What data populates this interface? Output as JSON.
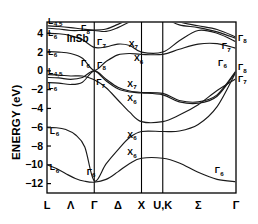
{
  "figure": {
    "material": "InSb",
    "ylabel": "ENERGY (eV)",
    "frame_color": "#000000",
    "band_color": "#1a1a1a",
    "background": "#ffffff"
  },
  "chart_data": {
    "type": "line",
    "title": "InSb",
    "xlabel": "",
    "ylabel": "ENERGY (eV)",
    "ylim": [
      -13.0,
      5.2
    ],
    "xlim": [
      0,
      4
    ],
    "grid": false,
    "legend": "none",
    "xticks": [
      {
        "pos": 0.0,
        "label": "L"
      },
      {
        "pos": 1.0,
        "label": "Γ"
      },
      {
        "pos": 2.0,
        "label": "X"
      },
      {
        "pos": 2.45,
        "label": "U,K"
      },
      {
        "pos": 4.0,
        "label": "Γ"
      }
    ],
    "xtick_midlabels": [
      {
        "pos": 0.5,
        "label": "Λ"
      },
      {
        "pos": 1.5,
        "label": "Δ"
      },
      {
        "pos": 3.2,
        "label": "Σ"
      }
    ],
    "yticks": [
      4,
      2,
      0,
      -2,
      -4,
      -6,
      -8,
      -10,
      -12
    ],
    "ytick_labels": [
      "4",
      "2",
      "0",
      "−2",
      "−4",
      "−6",
      "−8",
      "−10",
      "−12"
    ],
    "symmetry_lines": [
      1.0,
      2.0,
      2.45
    ],
    "series": [
      {
        "name": "valence-band-1",
        "x": [
          0.0,
          0.2,
          0.4,
          0.6,
          0.8,
          1.0,
          1.25,
          1.5,
          1.75,
          2.0,
          2.45,
          2.8,
          3.2,
          3.6,
          4.0
        ],
        "values": [
          -10.0,
          -10.4,
          -10.95,
          -11.45,
          -11.75,
          -11.85,
          -11.55,
          -10.75,
          -9.85,
          -9.3,
          -9.3,
          -9.8,
          -10.8,
          -11.55,
          -11.8
        ]
      },
      {
        "name": "valence-band-2",
        "x": [
          0.0,
          0.2,
          0.4,
          0.6,
          0.8,
          1.0,
          1.25,
          1.5,
          1.75,
          2.0,
          2.45,
          2.8,
          3.2,
          3.6,
          4.0
        ],
        "values": [
          -6.05,
          -6.05,
          -6.25,
          -6.8,
          -8.1,
          -11.7,
          -9.9,
          -8.4,
          -7.1,
          -6.45,
          -6.45,
          -6.4,
          -5.7,
          -3.8,
          -0.1
        ]
      },
      {
        "name": "valence-band-3-heavy",
        "x": [
          0.0,
          0.25,
          0.5,
          0.75,
          1.0,
          1.25,
          1.5,
          1.75,
          2.0,
          2.45,
          2.8,
          3.2,
          3.6,
          4.0
        ],
        "values": [
          -1.25,
          -1.3,
          -1.45,
          -1.2,
          0.0,
          -0.9,
          -1.75,
          -2.15,
          -2.3,
          -2.4,
          -3.15,
          -3.3,
          -2.55,
          0.0
        ]
      },
      {
        "name": "valence-band-4-light",
        "x": [
          0.0,
          0.25,
          0.5,
          0.75,
          1.0,
          1.25,
          1.5,
          1.75,
          2.0,
          2.45,
          2.8,
          3.2,
          3.6,
          4.0
        ],
        "values": [
          -0.7,
          -0.75,
          -0.9,
          -0.7,
          0.0,
          -1.05,
          -1.9,
          -2.25,
          -2.35,
          -2.55,
          -3.3,
          -3.45,
          -2.7,
          -0.1
        ]
      },
      {
        "name": "split-off-band",
        "x": [
          0.0,
          0.25,
          0.5,
          0.75,
          1.0,
          1.25,
          1.5,
          1.75,
          2.0,
          2.45,
          2.8,
          3.2,
          3.6,
          4.0
        ],
        "values": [
          -0.4,
          -0.45,
          -0.55,
          -0.55,
          -0.95,
          -1.8,
          -3.1,
          -4.4,
          -5.4,
          -5.4,
          -4.7,
          -3.6,
          -2.1,
          -0.85
        ]
      },
      {
        "name": "conduction-band-1",
        "x": [
          0.0,
          0.25,
          0.5,
          0.75,
          1.0,
          1.25,
          1.5,
          1.75,
          2.0,
          2.45,
          2.8,
          3.2,
          3.6,
          4.0
        ],
        "values": [
          2.05,
          2.0,
          1.85,
          1.35,
          0.05,
          1.0,
          1.7,
          1.85,
          1.75,
          1.75,
          2.3,
          2.85,
          2.9,
          2.4
        ]
      },
      {
        "name": "conduction-band-2",
        "x": [
          0.0,
          0.25,
          0.5,
          0.75,
          1.0,
          1.25,
          1.5,
          1.75,
          2.0,
          2.45,
          2.8,
          3.2,
          3.6,
          4.0
        ],
        "values": [
          4.0,
          3.95,
          3.75,
          3.3,
          2.5,
          2.55,
          2.85,
          2.7,
          2.0,
          2.0,
          3.2,
          4.3,
          4.0,
          3.1
        ]
      },
      {
        "name": "conduction-band-3",
        "x": [
          0.0,
          0.25,
          0.5,
          0.75,
          1.0,
          1.25,
          1.5,
          1.75,
          2.0,
          2.45,
          2.8,
          3.2,
          3.6,
          4.0
        ],
        "values": [
          4.55,
          4.45,
          4.3,
          4.3,
          4.3,
          4.2,
          4.6,
          5.2,
          5.6,
          5.6,
          4.9,
          4.6,
          4.15,
          3.45
        ]
      },
      {
        "name": "conduction-band-4",
        "x": [
          0.0,
          0.25,
          0.5,
          0.75,
          1.0,
          1.25,
          1.5,
          1.75,
          2.0,
          2.45,
          2.8,
          3.2,
          3.6,
          4.0
        ],
        "values": [
          4.8,
          4.72,
          4.6,
          4.45,
          4.35,
          4.45,
          4.95,
          5.5,
          5.9,
          5.9,
          5.2,
          4.8,
          4.4,
          3.6
        ]
      }
    ],
    "annotations": [
      {
        "id": "L45-top",
        "text": "L",
        "sub": "4,5",
        "x": 0.02,
        "y": 5.0,
        "anchor": "start"
      },
      {
        "id": "L6-a",
        "text": "L",
        "sub": "6",
        "x": 0.02,
        "y": 3.7,
        "anchor": "start"
      },
      {
        "id": "L6-b",
        "text": "L",
        "sub": "6",
        "x": 0.02,
        "y": 1.7,
        "anchor": "start"
      },
      {
        "id": "L45-c",
        "text": "L",
        "sub": "4,5",
        "x": 0.02,
        "y": -0.3,
        "anchor": "start"
      },
      {
        "id": "L6-d",
        "text": "L",
        "sub": "6",
        "x": 0.02,
        "y": -1.9,
        "anchor": "start"
      },
      {
        "id": "L6-e",
        "text": "L",
        "sub": "6",
        "x": 0.06,
        "y": -6.7,
        "anchor": "start"
      },
      {
        "id": "L6-f",
        "text": "L",
        "sub": "6",
        "x": 0.06,
        "y": -10.6,
        "anchor": "start"
      },
      {
        "id": "G8-top",
        "text": "Γ",
        "sub": "8",
        "x": 0.72,
        "y": 4.25,
        "anchor": "start"
      },
      {
        "id": "G7-mid",
        "text": "Γ",
        "sub": "7",
        "x": 1.06,
        "y": 2.7,
        "anchor": "start"
      },
      {
        "id": "G6-left",
        "text": "Γ",
        "sub": "6",
        "x": 0.72,
        "y": 0.55,
        "anchor": "start"
      },
      {
        "id": "G8-zero",
        "text": "Γ",
        "sub": "8",
        "x": 1.06,
        "y": 0.35,
        "anchor": "start"
      },
      {
        "id": "G7-low",
        "text": "Γ",
        "sub": "7",
        "x": 1.04,
        "y": -1.55,
        "anchor": "start"
      },
      {
        "id": "G6-bot-l",
        "text": "Γ",
        "sub": "6",
        "x": 0.84,
        "y": -11.05,
        "anchor": "start"
      },
      {
        "id": "X7-upper",
        "text": "X",
        "sub": "7",
        "x": 1.73,
        "y": 2.55,
        "anchor": "start"
      },
      {
        "id": "X6-upper",
        "text": "X",
        "sub": "6",
        "x": 1.84,
        "y": 1.0,
        "anchor": "start"
      },
      {
        "id": "X7-lower",
        "text": "X",
        "sub": "7",
        "x": 1.7,
        "y": -1.7,
        "anchor": "start"
      },
      {
        "id": "X6-a",
        "text": "X",
        "sub": "6",
        "x": 1.7,
        "y": -3.2,
        "anchor": "start"
      },
      {
        "id": "X6-b",
        "text": "X",
        "sub": "6",
        "x": 1.7,
        "y": -7.1,
        "anchor": "start"
      },
      {
        "id": "X6-c",
        "text": "X",
        "sub": "6",
        "x": 1.7,
        "y": -9.0,
        "anchor": "start"
      },
      {
        "id": "G8-right",
        "text": "Γ",
        "sub": "8",
        "x": 4.04,
        "y": 3.2,
        "anchor": "start"
      },
      {
        "id": "G7-right",
        "text": "Γ",
        "sub": "7",
        "x": 3.7,
        "y": 2.3,
        "anchor": "start"
      },
      {
        "id": "G6-right",
        "text": "Γ",
        "sub": "6",
        "x": 3.62,
        "y": 0.55,
        "anchor": "start"
      },
      {
        "id": "G8-r0",
        "text": "Γ",
        "sub": "8",
        "x": 4.04,
        "y": 0.05,
        "anchor": "start"
      },
      {
        "id": "G7-r1",
        "text": "Γ",
        "sub": "7",
        "x": 4.04,
        "y": -1.15,
        "anchor": "start"
      },
      {
        "id": "G6-bot-r",
        "text": "Γ",
        "sub": "6",
        "x": 3.55,
        "y": -10.9,
        "anchor": "start"
      }
    ]
  }
}
